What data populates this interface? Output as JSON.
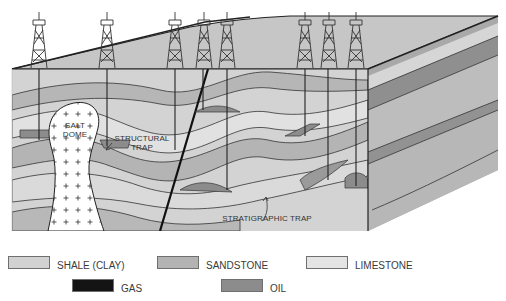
{
  "diagram": {
    "labels": {
      "salt_dome": [
        "SALT",
        "DOME"
      ],
      "structural_trap": [
        "STRUCTURAL",
        "TRAP"
      ],
      "stratigraphic_trap": "STRATIGRAPHIC TRAP"
    },
    "derrick_count": 8,
    "colors": {
      "shale": "#cfcfcf",
      "sandstone": "#b4b4b4",
      "limestone": "#e2e2e2",
      "gas": "#111111",
      "oil": "#8e8e8e",
      "side_face": "#a9a9a9",
      "top_surface": "#c6c6c6",
      "outline": "#222222"
    }
  },
  "legend": {
    "items": [
      {
        "label": "SHALE (CLAY)",
        "color": "#d2d2d2"
      },
      {
        "label": "SANDSTONE",
        "color": "#b3b3b3"
      },
      {
        "label": "LIMESTONE",
        "color": "#e4e4e4"
      },
      {
        "label": "GAS",
        "color": "#141414"
      },
      {
        "label": "OIL",
        "color": "#8c8c8c"
      }
    ]
  }
}
